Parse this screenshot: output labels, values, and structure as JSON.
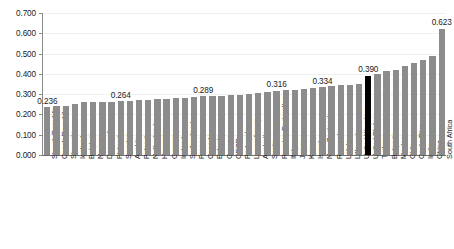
{
  "chart_data": {
    "type": "bar",
    "title": "",
    "subtitle": "",
    "xlabel": "",
    "ylabel": "",
    "ylim": [
      0.0,
      0.7
    ],
    "ytick_labels": [
      "0.000",
      "0.100",
      "0.200",
      "0.300",
      "0.400",
      "0.500",
      "0.600",
      "0.700"
    ],
    "ytick_values": [
      0.0,
      0.1,
      0.2,
      0.3,
      0.4,
      0.5,
      0.6,
      0.7
    ],
    "grid": true,
    "legend": "none",
    "bar_color": "#8c8c8c",
    "highlight_color": "#000000",
    "highlight_category": "United States",
    "categories": [
      "Slovak Republic",
      "Czech Republic",
      "Slovenia",
      "Iceland",
      "Belgium",
      "Norway",
      "Denmark",
      "Finland",
      "Sweden",
      "Austria",
      "Poland",
      "Netherlands",
      "Hungary",
      "Germany",
      "Ireland",
      "Switzerland",
      "France",
      "Canada",
      "Estonia",
      "Greece",
      "OECD",
      "Portugal",
      "Luxembourg",
      "Australia",
      "Spain",
      "Russian Federation",
      "Italy",
      "Japan",
      "Korea",
      "Israel",
      "New Zealand",
      "Romania",
      "Latvia",
      "Lithuania",
      "United Kingdom",
      "United States",
      "Turkey",
      "Bulgaria",
      "Mexico",
      "Chile",
      "Costa Rica",
      "India",
      "China",
      "South Africa"
    ],
    "values": [
      0.236,
      0.243,
      0.244,
      0.25,
      0.259,
      0.26,
      0.261,
      0.262,
      0.264,
      0.266,
      0.27,
      0.272,
      0.274,
      0.276,
      0.28,
      0.283,
      0.285,
      0.289,
      0.29,
      0.292,
      0.295,
      0.298,
      0.302,
      0.306,
      0.31,
      0.316,
      0.319,
      0.322,
      0.325,
      0.33,
      0.334,
      0.34,
      0.343,
      0.346,
      0.35,
      0.39,
      0.397,
      0.412,
      0.418,
      0.437,
      0.452,
      0.47,
      0.49,
      0.623
    ],
    "labeled_points": [
      {
        "category": "Slovak Republic",
        "value": 0.236,
        "label": "0.236"
      },
      {
        "category": "Sweden",
        "value": 0.264,
        "label": "0.264"
      },
      {
        "category": "Canada",
        "value": 0.289,
        "label": "0.289"
      },
      {
        "category": "Russian Federation",
        "value": 0.316,
        "label": "0.316"
      },
      {
        "category": "New Zealand",
        "value": 0.334,
        "label": "0.334"
      },
      {
        "category": "United States",
        "value": 0.39,
        "label": "0.390"
      },
      {
        "category": "South Africa",
        "value": 0.623,
        "label": "0.623"
      }
    ]
  }
}
